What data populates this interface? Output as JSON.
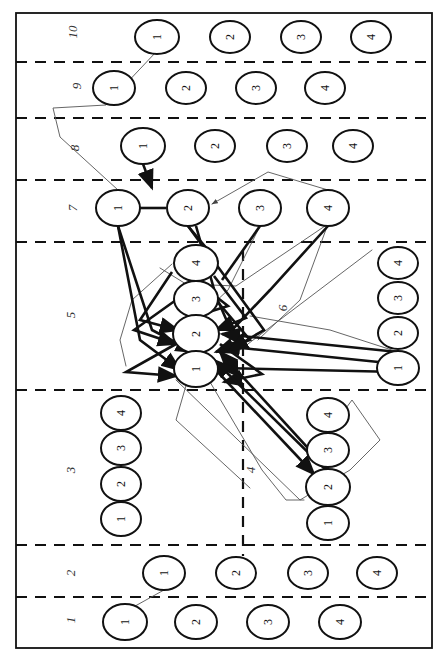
{
  "figure": {
    "width": 446,
    "height": 656,
    "orientation": "rotated-90",
    "background": "#ffffff",
    "stroke_color": "#111111",
    "thin_edge_color": "#555555"
  },
  "frame": {
    "x": 16,
    "y": 13,
    "width": 416,
    "height": 635
  },
  "band_separators_y": [
    62,
    118,
    180,
    242,
    390,
    545,
    597
  ],
  "vertical_separator": {
    "x": 243,
    "y1": 250,
    "y2": 556
  },
  "row_labels": [
    {
      "id": "10",
      "text": "10",
      "x": 72,
      "y": 32
    },
    {
      "id": "9",
      "text": "9",
      "x": 76,
      "y": 86
    },
    {
      "id": "8",
      "text": "8",
      "x": 74,
      "y": 148
    },
    {
      "id": "7",
      "text": "7",
      "x": 72,
      "y": 208
    },
    {
      "id": "5",
      "text": "5",
      "x": 70,
      "y": 315
    },
    {
      "id": "6",
      "text": "6",
      "x": 282,
      "y": 308
    },
    {
      "id": "3",
      "text": "3",
      "x": 70,
      "y": 470
    },
    {
      "id": "4",
      "text": "4",
      "x": 250,
      "y": 470
    },
    {
      "id": "2",
      "text": "2",
      "x": 70,
      "y": 573
    },
    {
      "id": "1",
      "text": "1",
      "x": 70,
      "y": 620
    }
  ],
  "groups": [
    {
      "group": "10",
      "nodes": [
        {
          "label": "1",
          "x": 157,
          "y": 37,
          "rx": 22,
          "ry": 17
        },
        {
          "label": "2",
          "x": 230,
          "y": 37,
          "rx": 20,
          "ry": 16
        },
        {
          "label": "3",
          "x": 301,
          "y": 37,
          "rx": 20,
          "ry": 16
        },
        {
          "label": "4",
          "x": 371,
          "y": 37,
          "rx": 20,
          "ry": 16
        }
      ]
    },
    {
      "group": "9",
      "nodes": [
        {
          "label": "1",
          "x": 114,
          "y": 88,
          "rx": 21,
          "ry": 17
        },
        {
          "label": "2",
          "x": 186,
          "y": 88,
          "rx": 20,
          "ry": 16
        },
        {
          "label": "3",
          "x": 256,
          "y": 88,
          "rx": 20,
          "ry": 16
        },
        {
          "label": "4",
          "x": 325,
          "y": 88,
          "rx": 20,
          "ry": 16
        }
      ]
    },
    {
      "group": "8",
      "nodes": [
        {
          "label": "1",
          "x": 143,
          "y": 146,
          "rx": 22,
          "ry": 18
        },
        {
          "label": "2",
          "x": 215,
          "y": 146,
          "rx": 20,
          "ry": 16
        },
        {
          "label": "3",
          "x": 287,
          "y": 146,
          "rx": 20,
          "ry": 16
        },
        {
          "label": "4",
          "x": 353,
          "y": 146,
          "rx": 20,
          "ry": 16
        }
      ]
    },
    {
      "group": "7",
      "nodes": [
        {
          "label": "1",
          "x": 118,
          "y": 208,
          "rx": 22,
          "ry": 18
        },
        {
          "label": "2",
          "x": 188,
          "y": 208,
          "rx": 21,
          "ry": 18
        },
        {
          "label": "3",
          "x": 260,
          "y": 208,
          "rx": 21,
          "ry": 18
        },
        {
          "label": "4",
          "x": 328,
          "y": 208,
          "rx": 21,
          "ry": 18
        }
      ]
    },
    {
      "group": "5",
      "nodes": [
        {
          "label": "4",
          "x": 196,
          "y": 263,
          "rx": 22,
          "ry": 18
        },
        {
          "label": "3",
          "x": 196,
          "y": 299,
          "rx": 22,
          "ry": 18
        },
        {
          "label": "2",
          "x": 196,
          "y": 334,
          "rx": 23,
          "ry": 19
        },
        {
          "label": "1",
          "x": 196,
          "y": 369,
          "rx": 22,
          "ry": 18
        }
      ]
    },
    {
      "group": "6",
      "nodes": [
        {
          "label": "4",
          "x": 398,
          "y": 263,
          "rx": 20,
          "ry": 16
        },
        {
          "label": "3",
          "x": 398,
          "y": 298,
          "rx": 20,
          "ry": 16
        },
        {
          "label": "2",
          "x": 398,
          "y": 333,
          "rx": 20,
          "ry": 16
        },
        {
          "label": "1",
          "x": 398,
          "y": 368,
          "rx": 21,
          "ry": 17
        }
      ]
    },
    {
      "group": "3",
      "nodes": [
        {
          "label": "4",
          "x": 121,
          "y": 413,
          "rx": 20,
          "ry": 17
        },
        {
          "label": "3",
          "x": 121,
          "y": 448,
          "rx": 20,
          "ry": 17
        },
        {
          "label": "2",
          "x": 121,
          "y": 484,
          "rx": 20,
          "ry": 17
        },
        {
          "label": "1",
          "x": 121,
          "y": 519,
          "rx": 20,
          "ry": 17
        }
      ]
    },
    {
      "group": "4",
      "nodes": [
        {
          "label": "4",
          "x": 328,
          "y": 415,
          "rx": 21,
          "ry": 17
        },
        {
          "label": "3",
          "x": 328,
          "y": 450,
          "rx": 21,
          "ry": 17
        },
        {
          "label": "2",
          "x": 328,
          "y": 487,
          "rx": 22,
          "ry": 18
        },
        {
          "label": "1",
          "x": 328,
          "y": 523,
          "rx": 21,
          "ry": 17
        }
      ]
    },
    {
      "group": "2",
      "nodes": [
        {
          "label": "1",
          "x": 164,
          "y": 573,
          "rx": 21,
          "ry": 17
        },
        {
          "label": "2",
          "x": 236,
          "y": 573,
          "rx": 20,
          "ry": 16
        },
        {
          "label": "3",
          "x": 308,
          "y": 573,
          "rx": 20,
          "ry": 16
        },
        {
          "label": "4",
          "x": 377,
          "y": 573,
          "rx": 20,
          "ry": 16
        }
      ]
    },
    {
      "group": "1",
      "nodes": [
        {
          "label": "1",
          "x": 125,
          "y": 622,
          "rx": 22,
          "ry": 18
        },
        {
          "label": "2",
          "x": 196,
          "y": 622,
          "rx": 21,
          "ry": 17
        },
        {
          "label": "3",
          "x": 268,
          "y": 622,
          "rx": 21,
          "ry": 17
        },
        {
          "label": "4",
          "x": 340,
          "y": 622,
          "rx": 21,
          "ry": 17
        }
      ]
    }
  ],
  "edges_thin": [
    {
      "id": "e-thin-1",
      "points": "156,52 106,105 53,108 60,137 118,190",
      "arrow": false
    },
    {
      "id": "e-thin-2",
      "points": "328,190 268,172 212,204",
      "arrow": true
    },
    {
      "id": "e-thin-3",
      "points": "328,224 236,286 186,284 160,268",
      "arrow": false
    },
    {
      "id": "e-thin-4",
      "points": "328,224 300,300 258,340",
      "arrow": false
    },
    {
      "id": "e-thin-5",
      "points": "260,226 228,290 200,316",
      "arrow": false
    },
    {
      "id": "e-thin-6",
      "points": "196,351 176,420 250,488",
      "arrow": false
    },
    {
      "id": "e-thin-7",
      "points": "176,380 300,500 350,470 380,440 352,400 330,430",
      "arrow": false
    },
    {
      "id": "e-thin-8",
      "points": "210,382 262,470 286,500 304,500",
      "arrow": false
    },
    {
      "id": "e-thin-9",
      "points": "164,590 128,610",
      "arrow": false
    },
    {
      "id": "e-thin-10",
      "points": "172,264 132,300 120,340 126,366",
      "arrow": false
    },
    {
      "id": "e-thin-11",
      "points": "398,352 330,330 250,316",
      "arrow": false
    },
    {
      "id": "e-thin-12",
      "points": "372,250 306,300 240,350",
      "arrow": false
    }
  ],
  "edges_bold": [
    {
      "id": "e-bold-1",
      "points": "143,164 152,188",
      "arrow": true
    },
    {
      "id": "e-bold-2",
      "points": "140,208 166,208",
      "arrow": false
    },
    {
      "id": "e-bold-3",
      "points": "188,226 218,262",
      "arrow": false
    },
    {
      "id": "e-bold-4",
      "points": "196,226 216,296 236,342",
      "arrow": false
    },
    {
      "id": "e-bold-5",
      "points": "118,226 152,330 194,352",
      "arrow": true
    },
    {
      "id": "e-bold-6",
      "points": "118,226 140,340 180,370",
      "arrow": true
    },
    {
      "id": "e-bold-7",
      "points": "172,272 140,320 178,330",
      "arrow": true
    },
    {
      "id": "e-bold-8",
      "points": "214,276 246,318 216,330",
      "arrow": true
    },
    {
      "id": "e-bold-9",
      "points": "176,300 134,330 176,344",
      "arrow": true
    },
    {
      "id": "e-bold-10",
      "points": "216,300 250,340 216,352",
      "arrow": true
    },
    {
      "id": "e-bold-11",
      "points": "176,344 126,372 176,376",
      "arrow": true
    },
    {
      "id": "e-bold-12",
      "points": "220,344 262,374 224,382",
      "arrow": true
    },
    {
      "id": "e-bold-13",
      "points": "398,352 222,334",
      "arrow": true
    },
    {
      "id": "e-bold-14",
      "points": "398,364 222,346",
      "arrow": true
    },
    {
      "id": "e-bold-15",
      "points": "398,372 220,368",
      "arrow": true
    },
    {
      "id": "e-bold-16",
      "points": "328,470 220,352",
      "arrow": true
    },
    {
      "id": "e-bold-17",
      "points": "328,472 214,360",
      "arrow": true
    },
    {
      "id": "e-bold-18",
      "points": "214,368 314,474",
      "arrow": true
    },
    {
      "id": "e-bold-19",
      "points": "188,226 232,286 264,330 230,350",
      "arrow": true
    },
    {
      "id": "e-bold-20",
      "points": "328,226 270,290 232,330",
      "arrow": false
    },
    {
      "id": "e-bold-21",
      "points": "260,226 222,280",
      "arrow": false
    },
    {
      "id": "e-bold-22",
      "points": "196,281 228,306 196,316",
      "arrow": false
    }
  ]
}
